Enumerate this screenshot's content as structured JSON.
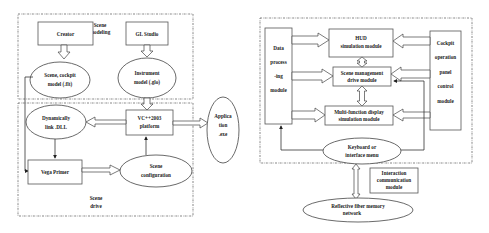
{
  "left_diagram": {
    "groups": {
      "scene_modeling": "Scene modeling",
      "scene_modeling_l1": "Scene",
      "scene_modeling_l2": "modeling",
      "scene_drive_l1": "Scene",
      "scene_drive_l2": "drive"
    },
    "nodes": {
      "creator": "Creator",
      "gl_studio": "GL Studio",
      "scene_cockpit_l1": "Scene, cockpit",
      "scene_cockpit_l2": "model (.flt)",
      "instrument_l1": "Instrument",
      "instrument_l2": "model (.glo)",
      "vc_l1": "VC++2003",
      "vc_l2": "platform",
      "dll_l1": "Dynamically",
      "dll_l2": "link .DLL",
      "vega": "Vega Primer",
      "scene_config_l1": "Scene",
      "scene_config_l2": "configuration",
      "app_l1": "Applica",
      "app_l2": "tion",
      "app_l3": ".exe"
    }
  },
  "right_diagram": {
    "nodes": {
      "data_l1": "Data",
      "data_l2": "process",
      "data_l3": "-ing",
      "data_l4": "module",
      "hud_l1": "HUD",
      "hud_l2": "simulation module",
      "scene_mgmt_l1": "Scene management",
      "scene_mgmt_l2": "drive module",
      "mfd_l1": "Multi-function display",
      "mfd_l2": "simulation module",
      "cockpit_l1": "Cockpit",
      "cockpit_l2": "operation",
      "cockpit_l3": "panel",
      "cockpit_l4": "control",
      "cockpit_l5": "module",
      "keyboard_l1": "Keyboard or",
      "keyboard_l2": "interface menu",
      "interaction_l1": "Interaction",
      "interaction_l2": "communication",
      "interaction_l3": "module",
      "fiber_l1": "Reflective fiber memory",
      "fiber_l2": "network"
    }
  },
  "colors": {
    "stroke": "#444444",
    "background": "#ffffff",
    "text": "#222222"
  }
}
